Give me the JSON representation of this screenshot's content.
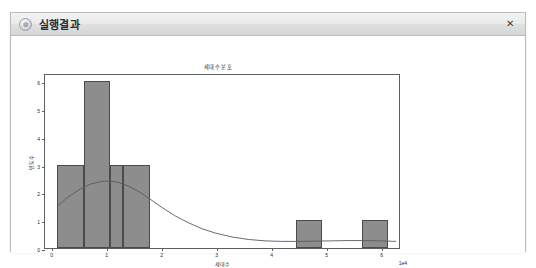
{
  "window": {
    "title": "실행결과",
    "icon": "app-circle-icon",
    "close_label": "✕"
  },
  "chart_data": {
    "type": "bar",
    "title": "세대수 분포",
    "xlabel": "세대수",
    "ylabel": "빈도수",
    "x_offset_text": "1e4",
    "xlim": [
      -0.12,
      6.35
    ],
    "ylim": [
      0,
      6.3
    ],
    "grid": false,
    "legend": false,
    "x_ticks": [
      "0",
      "1",
      "2",
      "3",
      "4",
      "5",
      "6"
    ],
    "x_tick_values": [
      0,
      1,
      2,
      3,
      4,
      5,
      6
    ],
    "y_ticks": [
      "0",
      "1",
      "2",
      "3",
      "4",
      "5",
      "6"
    ],
    "y_tick_values": [
      0,
      1,
      2,
      3,
      4,
      5,
      6
    ],
    "bars": [
      {
        "x0": 0.1,
        "x1": 0.58,
        "height": 3
      },
      {
        "x0": 0.58,
        "x1": 1.06,
        "height": 6
      },
      {
        "x0": 1.06,
        "x1": 1.3,
        "height": 3
      },
      {
        "x0": 1.3,
        "x1": 1.78,
        "height": 3
      },
      {
        "x0": 4.44,
        "x1": 4.92,
        "height": 1
      },
      {
        "x0": 5.64,
        "x1": 6.12,
        "height": 1
      }
    ],
    "kde_curve": [
      {
        "x": 0.1,
        "y": 1.52
      },
      {
        "x": 0.3,
        "y": 1.85
      },
      {
        "x": 0.5,
        "y": 2.12
      },
      {
        "x": 0.7,
        "y": 2.32
      },
      {
        "x": 0.9,
        "y": 2.42
      },
      {
        "x": 1.05,
        "y": 2.44
      },
      {
        "x": 1.2,
        "y": 2.4
      },
      {
        "x": 1.4,
        "y": 2.26
      },
      {
        "x": 1.6,
        "y": 2.05
      },
      {
        "x": 1.8,
        "y": 1.78
      },
      {
        "x": 2.0,
        "y": 1.5
      },
      {
        "x": 2.25,
        "y": 1.18
      },
      {
        "x": 2.5,
        "y": 0.92
      },
      {
        "x": 2.75,
        "y": 0.7
      },
      {
        "x": 3.0,
        "y": 0.54
      },
      {
        "x": 3.3,
        "y": 0.4
      },
      {
        "x": 3.6,
        "y": 0.31
      },
      {
        "x": 3.9,
        "y": 0.26
      },
      {
        "x": 4.2,
        "y": 0.24
      },
      {
        "x": 4.5,
        "y": 0.24
      },
      {
        "x": 4.8,
        "y": 0.25
      },
      {
        "x": 5.1,
        "y": 0.26
      },
      {
        "x": 5.4,
        "y": 0.27
      },
      {
        "x": 5.7,
        "y": 0.27
      },
      {
        "x": 6.0,
        "y": 0.26
      },
      {
        "x": 6.3,
        "y": 0.24
      }
    ],
    "colors": {
      "bar_fill": "#8d8d8d",
      "bar_edge": "#4b4b4b",
      "kde_line": "#5a5a5a",
      "axis": "#5b5f63",
      "text": "#2a2a2a"
    }
  },
  "artifacts": {
    "marks": [
      "ᵛ",
      "ᴠᵛᵢ",
      "ᵛᵧ",
      "·",
      "·"
    ]
  }
}
